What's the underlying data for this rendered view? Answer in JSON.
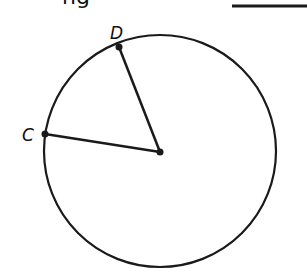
{
  "header": {
    "cut_text": "ng",
    "answer_blank": ""
  },
  "diagram": {
    "circle": {
      "cx": 160,
      "cy": 151,
      "r": 116
    },
    "center": {
      "x": 160,
      "y": 152
    },
    "points": [
      {
        "label": "D",
        "x": 119,
        "y": 47
      },
      {
        "label": "C",
        "x": 45,
        "y": 134
      }
    ],
    "stroke_color": "#1a1a1a"
  }
}
